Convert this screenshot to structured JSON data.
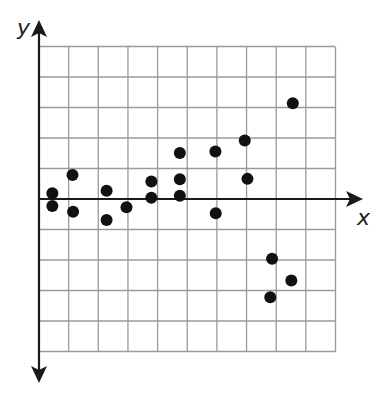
{
  "chart_data": {
    "type": "scatter",
    "title": "",
    "xlabel": "x",
    "ylabel": "y",
    "xlim": [
      0,
      10
    ],
    "ylim": [
      -5,
      5
    ],
    "grid": true,
    "grid_step": 1,
    "tick_labels": false,
    "legend": null,
    "colors": {
      "points": "#111111",
      "grid": "#9a9a9a",
      "axes": "#1a1a1a",
      "background": "#ffffff"
    },
    "points": [
      {
        "x": 0.45,
        "y": 0.19
      },
      {
        "x": 0.45,
        "y": -0.23
      },
      {
        "x": 1.13,
        "y": 0.79
      },
      {
        "x": 1.15,
        "y": -0.42
      },
      {
        "x": 2.28,
        "y": 0.27
      },
      {
        "x": 2.28,
        "y": -0.69
      },
      {
        "x": 2.95,
        "y": -0.27
      },
      {
        "x": 3.79,
        "y": 0.57
      },
      {
        "x": 3.79,
        "y": 0.04
      },
      {
        "x": 4.75,
        "y": 1.51
      },
      {
        "x": 4.75,
        "y": 0.65
      },
      {
        "x": 4.75,
        "y": 0.11
      },
      {
        "x": 5.95,
        "y": 1.56
      },
      {
        "x": 5.96,
        "y": -0.47
      },
      {
        "x": 6.94,
        "y": 1.92
      },
      {
        "x": 7.03,
        "y": 0.66
      },
      {
        "x": 7.86,
        "y": -1.96
      },
      {
        "x": 8.51,
        "y": -2.67
      },
      {
        "x": 7.8,
        "y": -3.22
      },
      {
        "x": 8.56,
        "y": 3.14
      }
    ]
  },
  "layout": {
    "origin_px": [
      39,
      199
    ],
    "unit_px_x": 29.65,
    "unit_px_y": 30.5,
    "grid_left_px": 39,
    "grid_right_px": 335.5,
    "grid_top_px": 47,
    "grid_bottom_px": 352,
    "x_axis_end_px": 363,
    "y_axis_top_px": 20,
    "y_axis_bottom_px": 383,
    "point_radius_px": 6,
    "x_label_pos": [
      357,
      225
    ],
    "y_label_pos": [
      17,
      35
    ]
  }
}
